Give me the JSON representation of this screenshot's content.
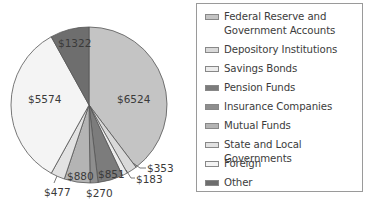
{
  "chart_data": {
    "type": "pie",
    "title": "",
    "start_angle_deg": 0,
    "direction": "clockwise",
    "legend_position": "right",
    "slices": [
      {
        "label": "Federal Reserve and Government Accounts",
        "value": 6524,
        "display": "$6524",
        "color": "#c4c4c4"
      },
      {
        "label": "Depository Institutions",
        "value": 353,
        "display": "$353",
        "color": "#d9d9d9"
      },
      {
        "label": "Savings Bonds",
        "value": 183,
        "display": "$183",
        "color": "#ececec"
      },
      {
        "label": "Pension Funds",
        "value": 851,
        "display": "$851",
        "color": "#7c7c7c"
      },
      {
        "label": "Insurance Companies",
        "value": 270,
        "display": "$270",
        "color": "#8e8e8e"
      },
      {
        "label": "Mutual Funds",
        "value": 880,
        "display": "$880",
        "color": "#b4b4b4"
      },
      {
        "label": "State and Local Governments",
        "value": 477,
        "display": "$477",
        "color": "#e2e2e2"
      },
      {
        "label": "Foreign",
        "value": 5574,
        "display": "$5574",
        "color": "#f4f4f4"
      },
      {
        "label": "Other",
        "value": 1322,
        "display": "$1322",
        "color": "#6e6e6e"
      }
    ],
    "total": 16434
  },
  "legend": {
    "items": [
      {
        "label": "Federal Reserve and Government Accounts",
        "color": "#c4c4c4"
      },
      {
        "label": "Depository Institutions",
        "color": "#d9d9d9"
      },
      {
        "label": "Savings Bonds",
        "color": "#ececec"
      },
      {
        "label": "Pension Funds",
        "color": "#7c7c7c"
      },
      {
        "label": "Insurance Companies",
        "color": "#8e8e8e"
      },
      {
        "label": "Mutual Funds",
        "color": "#b4b4b4"
      },
      {
        "label": "State and Local Governments",
        "color": "#e2e2e2"
      },
      {
        "label": "Foreign",
        "color": "#f4f4f4"
      },
      {
        "label": "Other",
        "color": "#6e6e6e"
      }
    ]
  }
}
